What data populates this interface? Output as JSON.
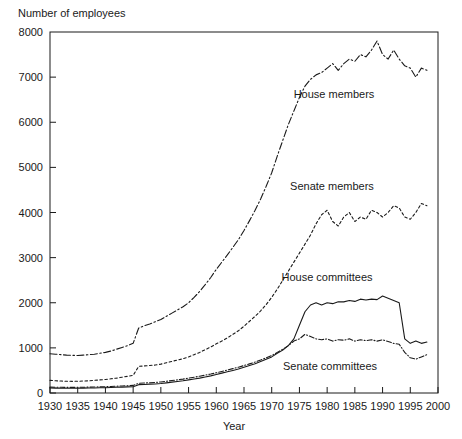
{
  "chart_data": {
    "type": "line",
    "title": "",
    "xlabel": "Year",
    "ylabel": "Number of employees",
    "ylabel_position": "top-left",
    "xlim": [
      1930,
      2000
    ],
    "ylim": [
      0,
      8000
    ],
    "grid": false,
    "legend_position": "inline-annotations",
    "xticks": [
      1930,
      1935,
      1940,
      1945,
      1950,
      1955,
      1960,
      1965,
      1970,
      1975,
      1980,
      1985,
      1990,
      1995,
      2000
    ],
    "xtick_labels": [
      "1930",
      "1935",
      "1940",
      "1945",
      "1950",
      "1955",
      "1960",
      "1965",
      "1970",
      "1975",
      "1980",
      "1985",
      "1990",
      "1995",
      "2000"
    ],
    "yticks": [
      0,
      1000,
      2000,
      3000,
      4000,
      5000,
      6000,
      7000,
      8000
    ],
    "ytick_labels": [
      "0",
      "1000",
      "2000",
      "3000",
      "4000",
      "5000",
      "6000",
      "7000",
      "8000"
    ],
    "x": [
      1930,
      1931,
      1932,
      1933,
      1934,
      1935,
      1936,
      1937,
      1938,
      1939,
      1940,
      1941,
      1942,
      1943,
      1944,
      1945,
      1946,
      1947,
      1948,
      1949,
      1950,
      1951,
      1952,
      1953,
      1954,
      1955,
      1956,
      1957,
      1958,
      1959,
      1960,
      1961,
      1962,
      1963,
      1964,
      1965,
      1966,
      1967,
      1968,
      1969,
      1970,
      1971,
      1972,
      1973,
      1974,
      1975,
      1976,
      1977,
      1978,
      1979,
      1980,
      1981,
      1982,
      1983,
      1984,
      1985,
      1986,
      1987,
      1988,
      1989,
      1990,
      1991,
      1992,
      1993,
      1994,
      1995,
      1996,
      1997,
      1998
    ],
    "series": [
      {
        "name": "House members",
        "line_style": "dash-dot",
        "annotation": "House members",
        "values": [
          870,
          860,
          850,
          840,
          835,
          830,
          840,
          850,
          860,
          880,
          900,
          930,
          970,
          1010,
          1050,
          1100,
          1440,
          1490,
          1530,
          1580,
          1630,
          1700,
          1770,
          1840,
          1910,
          2000,
          2120,
          2250,
          2400,
          2560,
          2740,
          2900,
          3060,
          3230,
          3400,
          3600,
          3820,
          4050,
          4300,
          4580,
          4880,
          5250,
          5600,
          5950,
          6250,
          6550,
          6800,
          6950,
          7050,
          7100,
          7200,
          7300,
          7150,
          7300,
          7400,
          7350,
          7500,
          7450,
          7600,
          7800,
          7500,
          7400,
          7600,
          7400,
          7250,
          7200,
          7000,
          7200,
          7150
        ]
      },
      {
        "name": "Senate members",
        "line_style": "fine-dashed",
        "annotation": "Senate members",
        "values": [
          280,
          270,
          265,
          260,
          258,
          260,
          265,
          270,
          280,
          290,
          300,
          315,
          330,
          350,
          370,
          390,
          590,
          600,
          610,
          620,
          640,
          670,
          700,
          730,
          760,
          800,
          850,
          900,
          960,
          1020,
          1090,
          1150,
          1220,
          1300,
          1380,
          1480,
          1590,
          1700,
          1820,
          1960,
          2120,
          2300,
          2500,
          2700,
          2900,
          3100,
          3300,
          3500,
          3750,
          3950,
          4050,
          3800,
          3700,
          3900,
          4000,
          3800,
          3900,
          3850,
          4050,
          4000,
          3900,
          4000,
          4150,
          4100,
          3900,
          3850,
          4000,
          4200,
          4150
        ]
      },
      {
        "name": "House committees",
        "line_style": "solid",
        "annotation": "House committees",
        "values": [
          110,
          108,
          106,
          105,
          105,
          106,
          108,
          110,
          112,
          115,
          118,
          122,
          126,
          130,
          135,
          140,
          185,
          190,
          196,
          200,
          210,
          225,
          240,
          255,
          270,
          290,
          310,
          330,
          355,
          380,
          410,
          440,
          470,
          500,
          530,
          570,
          610,
          650,
          700,
          750,
          800,
          880,
          950,
          1050,
          1200,
          1500,
          1800,
          1950,
          2000,
          1950,
          2000,
          1980,
          2020,
          2020,
          2050,
          2030,
          2080,
          2060,
          2080,
          2070,
          2150,
          2100,
          2050,
          2000,
          1200,
          1100,
          1150,
          1100,
          1130
        ]
      },
      {
        "name": "Senate committees",
        "line_style": "dash-dot-fine",
        "annotation": "Senate committees",
        "values": [
          130,
          128,
          126,
          125,
          125,
          126,
          128,
          130,
          133,
          136,
          140,
          145,
          150,
          156,
          162,
          168,
          215,
          222,
          228,
          235,
          245,
          260,
          276,
          292,
          308,
          328,
          350,
          372,
          396,
          420,
          448,
          478,
          508,
          540,
          572,
          608,
          645,
          685,
          730,
          780,
          830,
          900,
          970,
          1050,
          1150,
          1200,
          1300,
          1250,
          1200,
          1180,
          1200,
          1150,
          1180,
          1170,
          1200,
          1150,
          1180,
          1160,
          1180,
          1150,
          1180,
          1140,
          1100,
          1080,
          900,
          780,
          750,
          800,
          850
        ]
      }
    ]
  }
}
